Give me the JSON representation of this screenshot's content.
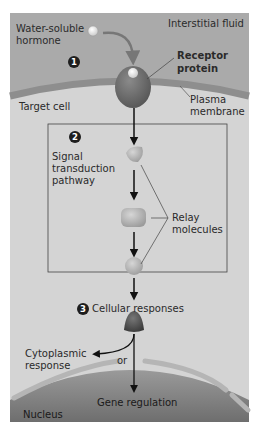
{
  "diagram": {
    "extracellular_label": "Interstitial fluid",
    "hormone_label": [
      "Water-soluble",
      "hormone"
    ],
    "receptor_label": [
      "Receptor",
      "protein"
    ],
    "membrane_label": [
      "Plasma",
      "membrane"
    ],
    "cell_label": "Target cell",
    "step1": "1",
    "step2": "2",
    "step2_label": [
      "Signal",
      "transduction",
      "pathway"
    ],
    "relay_label": [
      "Relay",
      "molecules"
    ],
    "step3": "3",
    "step3_label": "Cellular responses",
    "cytoplasmic_label": [
      "Cytoplasmic",
      "response"
    ],
    "or_label": "or",
    "gene_label": "Gene regulation",
    "nucleus_label": "Nucleus",
    "colors": {
      "interstitial": "#aaaaaa",
      "membrane": "#8e8e8e",
      "cytoplasm": "#d4d4d4",
      "receptor": "#6f6f6f",
      "relay": "#b9b9b9",
      "nucleus": "#8a8a8a",
      "badge": "#1e1e1e"
    }
  }
}
